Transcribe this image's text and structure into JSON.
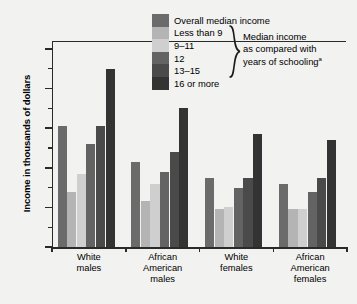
{
  "axes": {
    "ylabel": "Income in thousands of dollars",
    "ytick_labels": [
      "$50",
      "40",
      "30",
      "20",
      "10",
      "0"
    ],
    "ytick_values": [
      50,
      40,
      30,
      20,
      10,
      0
    ],
    "yminor_values": [
      45,
      35,
      25,
      15,
      5
    ],
    "ylim": [
      0,
      52
    ]
  },
  "legend": {
    "entries": [
      {
        "label": "Overall median income",
        "color": "#6b6b6b"
      },
      {
        "label": "Less than 9",
        "color": "#b4b4b4"
      },
      {
        "label": "9–11",
        "color": "#cfcfcf"
      },
      {
        "label": "12",
        "color": "#636363"
      },
      {
        "label": "13–15",
        "color": "#4a4a4a"
      },
      {
        "label": "16 or more",
        "color": "#333333"
      }
    ],
    "note_line1": "Median income",
    "note_line2": "as compared with",
    "note_line3": "years of schooling",
    "note_superscript": "a"
  },
  "chart_data": {
    "type": "bar",
    "title": "",
    "xlabel": "",
    "ylabel": "Income in thousands of dollars",
    "ylim": [
      0,
      52
    ],
    "grid": false,
    "legend_position": "top-center",
    "categories": [
      "White males",
      "African American males",
      "White females",
      "African American females"
    ],
    "category_lines": [
      [
        "White",
        "males"
      ],
      [
        "African",
        "American",
        "males"
      ],
      [
        "White",
        "females"
      ],
      [
        "African",
        "American",
        "females"
      ]
    ],
    "series": [
      {
        "name": "Overall median income",
        "color": "#6b6b6b",
        "values": [
          30.5,
          21.5,
          17.5,
          16.0
        ]
      },
      {
        "name": "Less than 9",
        "color": "#b4b4b4",
        "values": [
          14.0,
          11.5,
          9.5,
          9.5
        ]
      },
      {
        "name": "9–11",
        "color": "#cfcfcf",
        "values": [
          18.5,
          16.0,
          10.0,
          9.5
        ]
      },
      {
        "name": "12",
        "color": "#636363",
        "values": [
          26.0,
          19.0,
          15.0,
          14.0
        ]
      },
      {
        "name": "13–15",
        "color": "#4a4a4a",
        "values": [
          30.5,
          24.0,
          17.5,
          17.5
        ]
      },
      {
        "name": "16 or more",
        "color": "#333333",
        "values": [
          45.0,
          35.0,
          28.5,
          27.0
        ]
      }
    ]
  }
}
